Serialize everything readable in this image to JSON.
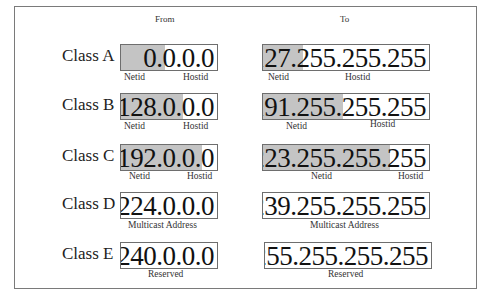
{
  "headers": {
    "from": "From",
    "to": "To"
  },
  "colors": {
    "netid_shade": "#c4c4c4",
    "border": "#6e6e6e",
    "frame": "#7a7a7a"
  },
  "rows": [
    {
      "label": "Class A",
      "from": {
        "address": "0.0.0.0",
        "captions": [
          "Netid",
          "Hostid"
        ]
      },
      "to": {
        "address": "127.255.255.255",
        "captions": [
          "Netid",
          "Hostid"
        ]
      }
    },
    {
      "label": "Class B",
      "from": {
        "address": "128.0.0.0",
        "captions": [
          "Netid",
          "Hostid"
        ]
      },
      "to": {
        "address": "191.255.255.255",
        "captions": [
          "Netid",
          "Hostid"
        ]
      }
    },
    {
      "label": "Class C",
      "from": {
        "address": "192.0.0.0",
        "captions": [
          "Netid",
          "Hostid"
        ]
      },
      "to": {
        "address": "223.255.255.255",
        "captions": [
          "Netid",
          "Hostid"
        ]
      }
    },
    {
      "label": "Class D",
      "from": {
        "address": "224.0.0.0",
        "captions": [
          "Multicast Address"
        ]
      },
      "to": {
        "address": "239.255.255.255",
        "captions": [
          "Multicast Address"
        ]
      }
    },
    {
      "label": "Class E",
      "from": {
        "address": "240.0.0.0",
        "captions": [
          "Reserved"
        ]
      },
      "to": {
        "address": "255.255.255.255",
        "captions": [
          "Reserved"
        ]
      }
    }
  ]
}
